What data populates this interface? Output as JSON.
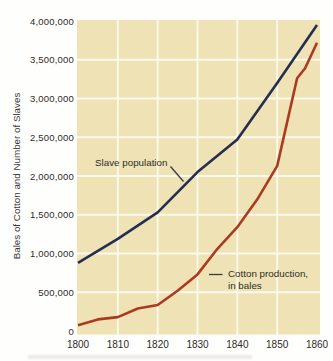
{
  "colors": {
    "page_background": "#fefefc",
    "plot_background": "#efe3b5",
    "gridline": "#fcfaee",
    "slave_line": "#262d52",
    "cotton_line": "#ac3a22",
    "text": "#2e2c2a",
    "leader_line": "#3a3a3a"
  },
  "chart_data": {
    "type": "line",
    "title": "",
    "y_axis_title": "Bales of Cotton and Number of Slaves",
    "x_range": [
      1800,
      1860
    ],
    "y_range": [
      0,
      4000000
    ],
    "grid": true,
    "x_tick_values": [
      1800,
      1810,
      1820,
      1830,
      1840,
      1850,
      1860
    ],
    "x_tick_labels": [
      "1800",
      "1810",
      "1820",
      "1830",
      "1840",
      "1850",
      "1860"
    ],
    "y_tick_values": [
      0,
      500000,
      1000000,
      1500000,
      2000000,
      2500000,
      3000000,
      3500000,
      4000000
    ],
    "y_tick_labels": [
      "0",
      "500,000",
      "1,000,000",
      "1,500,000",
      "2,000,000",
      "2,500,000",
      "3,000,000",
      "3,500,000",
      "4,000,000"
    ],
    "series": [
      {
        "name": "Slave population",
        "color": "#262d52",
        "points": [
          [
            1800,
            880000
          ],
          [
            1810,
            1190000
          ],
          [
            1820,
            1530000
          ],
          [
            1830,
            2050000
          ],
          [
            1840,
            2470000
          ],
          [
            1850,
            3200000
          ],
          [
            1860,
            3950000
          ]
        ]
      },
      {
        "name": "Cotton production, in bales",
        "color": "#ac3a22",
        "points": [
          [
            1800,
            75000
          ],
          [
            1805,
            150000
          ],
          [
            1810,
            180000
          ],
          [
            1815,
            290000
          ],
          [
            1820,
            335000
          ],
          [
            1825,
            520000
          ],
          [
            1830,
            730000
          ],
          [
            1835,
            1060000
          ],
          [
            1840,
            1340000
          ],
          [
            1845,
            1700000
          ],
          [
            1850,
            2130000
          ],
          [
            1855,
            3260000
          ],
          [
            1857,
            3390000
          ],
          [
            1860,
            3720000
          ]
        ]
      }
    ],
    "annotations": {
      "slave": "Slave population",
      "cotton_line1": "Cotton production,",
      "cotton_line2": "in bales"
    },
    "legend_position": "none"
  }
}
